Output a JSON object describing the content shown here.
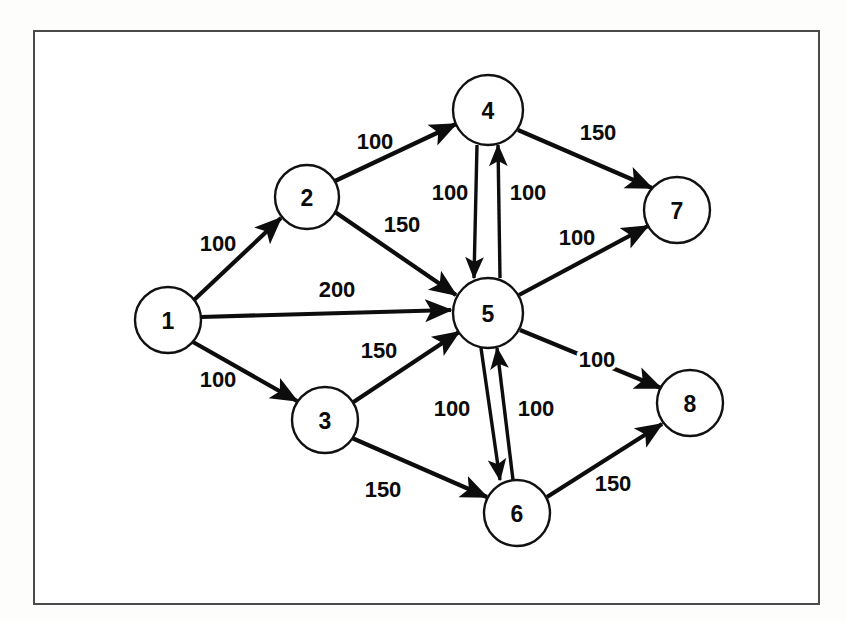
{
  "figure": {
    "kind": "directed-network-flow-graph",
    "border_color": "#4a4a4a",
    "node_fill": "#ffffff",
    "node_stroke": "#111111",
    "edge_color": "#0d0d0d"
  },
  "chart_data": {
    "type": "diagram",
    "title": "",
    "xlabel": "",
    "ylabel": "",
    "layout": "left-to-right directed network with central hub node 5",
    "nodes": [
      {
        "id": "1",
        "label": "1",
        "cx": 168,
        "cy": 320,
        "r": 33
      },
      {
        "id": "2",
        "label": "2",
        "cx": 307,
        "cy": 197,
        "r": 32
      },
      {
        "id": "3",
        "label": "3",
        "cx": 325,
        "cy": 420,
        "r": 33
      },
      {
        "id": "4",
        "label": "4",
        "cx": 488,
        "cy": 110,
        "r": 35
      },
      {
        "id": "5",
        "label": "5",
        "cx": 488,
        "cy": 313,
        "r": 35
      },
      {
        "id": "6",
        "label": "6",
        "cx": 517,
        "cy": 513,
        "r": 33
      },
      {
        "id": "7",
        "label": "7",
        "cx": 677,
        "cy": 210,
        "r": 33
      },
      {
        "id": "8",
        "label": "8",
        "cx": 690,
        "cy": 403,
        "r": 33
      }
    ],
    "edges": [
      {
        "from": "1",
        "to": "2",
        "weight": "100",
        "lx": 218,
        "ly": 243
      },
      {
        "from": "1",
        "to": "5",
        "weight": "200",
        "lx": 337,
        "ly": 289
      },
      {
        "from": "1",
        "to": "3",
        "weight": "100",
        "lx": 218,
        "ly": 379
      },
      {
        "from": "2",
        "to": "4",
        "weight": "100",
        "lx": 375,
        "ly": 141
      },
      {
        "from": "2",
        "to": "5",
        "weight": "150",
        "lx": 402,
        "ly": 224
      },
      {
        "from": "3",
        "to": "5",
        "weight": "150",
        "lx": 379,
        "ly": 350
      },
      {
        "from": "3",
        "to": "6",
        "weight": "150",
        "lx": 383,
        "ly": 489
      },
      {
        "from": "4",
        "to": "5",
        "weight": "100",
        "lx": 450,
        "ly": 192
      },
      {
        "from": "5",
        "to": "4",
        "weight": "100",
        "lx": 528,
        "ly": 192
      },
      {
        "from": "4",
        "to": "7",
        "weight": "150",
        "lx": 598,
        "ly": 132
      },
      {
        "from": "5",
        "to": "7",
        "weight": "100",
        "lx": 577,
        "ly": 237
      },
      {
        "from": "5",
        "to": "8",
        "weight": "100",
        "lx": 597,
        "ly": 359
      },
      {
        "from": "5",
        "to": "6",
        "weight": "100",
        "lx": 452,
        "ly": 408
      },
      {
        "from": "6",
        "to": "5",
        "weight": "100",
        "lx": 536,
        "ly": 408
      },
      {
        "from": "6",
        "to": "8",
        "weight": "150",
        "lx": 613,
        "ly": 483
      }
    ],
    "edge_geometry": [
      {
        "id": "e-1-2",
        "x1": 194,
        "y1": 300,
        "x2": 281,
        "y2": 218
      },
      {
        "id": "e-1-5",
        "x1": 201,
        "y1": 317,
        "x2": 451,
        "y2": 310
      },
      {
        "id": "e-1-3",
        "x1": 193,
        "y1": 342,
        "x2": 297,
        "y2": 401
      },
      {
        "id": "e-2-4",
        "x1": 335,
        "y1": 181,
        "x2": 456,
        "y2": 124
      },
      {
        "id": "e-2-5",
        "x1": 335,
        "y1": 212,
        "x2": 456,
        "y2": 295
      },
      {
        "id": "e-3-5",
        "x1": 352,
        "y1": 403,
        "x2": 459,
        "y2": 332
      },
      {
        "id": "e-3-6",
        "x1": 352,
        "y1": 438,
        "x2": 487,
        "y2": 497
      },
      {
        "id": "e-4-5",
        "x1": 477,
        "y1": 145,
        "x2": 474,
        "y2": 278
      },
      {
        "id": "e-5-4",
        "x1": 500,
        "y1": 278,
        "x2": 498,
        "y2": 145
      },
      {
        "id": "e-4-7",
        "x1": 518,
        "y1": 130,
        "x2": 652,
        "y2": 188
      },
      {
        "id": "e-5-7",
        "x1": 519,
        "y1": 295,
        "x2": 648,
        "y2": 226
      },
      {
        "id": "e-5-8",
        "x1": 520,
        "y1": 330,
        "x2": 661,
        "y2": 388
      },
      {
        "id": "e-5-6",
        "x1": 481,
        "y1": 348,
        "x2": 500,
        "y2": 480
      },
      {
        "id": "e-6-5",
        "x1": 513,
        "y1": 480,
        "x2": 497,
        "y2": 348
      },
      {
        "id": "e-6-8",
        "x1": 547,
        "y1": 497,
        "x2": 662,
        "y2": 424
      }
    ]
  }
}
